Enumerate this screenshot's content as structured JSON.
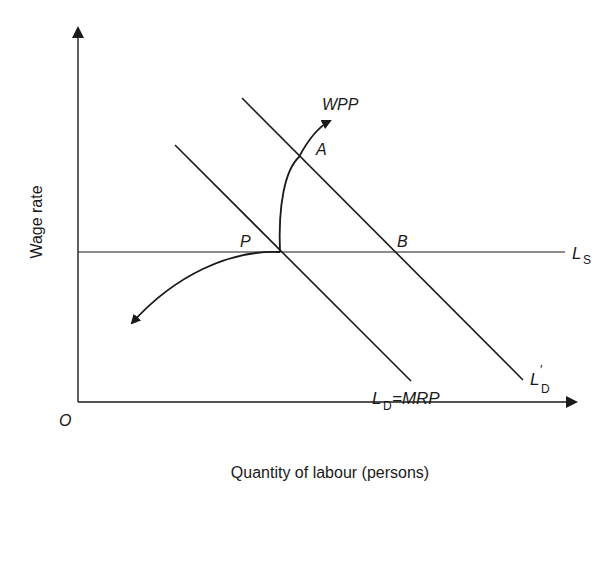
{
  "diagram": {
    "axes": {
      "origin_label": "O",
      "y_label": "Wage rate",
      "x_label": "Quantity of labour (persons)"
    },
    "curves": {
      "supply": {
        "symbol": "L",
        "subscript": "S"
      },
      "demand": {
        "symbol": "L",
        "subscript": "D",
        "suffix": "=MRP"
      },
      "demand_shifted": {
        "symbol": "L",
        "prime": "′",
        "subscript": "D"
      },
      "wpp_label": "WPP"
    },
    "points": {
      "p": "P",
      "a": "A",
      "b": "B"
    },
    "colors": {
      "line": "#1a1a1a",
      "background": "#ffffff"
    }
  }
}
